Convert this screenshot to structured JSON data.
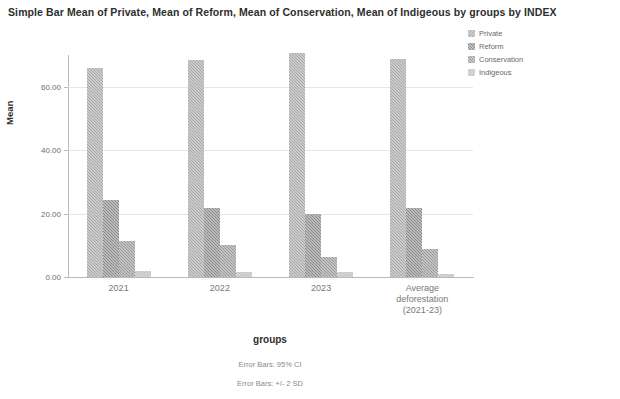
{
  "chart_data": {
    "type": "bar",
    "title": "Simple Bar Mean of Private, Mean of Reform, Mean of Conservation, Mean of Indigeous by groups by INDEX",
    "xlabel": "groups",
    "ylabel": "Mean",
    "ylim": [
      0,
      70
    ],
    "yticks": [
      0,
      20,
      40,
      60
    ],
    "ytick_labels": [
      "0.00",
      "20.00",
      "40.00",
      "60.00"
    ],
    "grid": true,
    "legend_position": "top-right",
    "categories": [
      "2021",
      "2022",
      "2023",
      "Average deforestation (2021-23)"
    ],
    "category_lines": [
      [
        "2021"
      ],
      [
        "2022"
      ],
      [
        "2023"
      ],
      [
        "Average",
        "deforestation",
        "(2021-23)"
      ]
    ],
    "series": [
      {
        "name": "Private",
        "color": "#a8a8a8",
        "values": [
          66.0,
          68.5,
          70.6,
          68.7
        ]
      },
      {
        "name": "Reform",
        "color": "#8c8c8c",
        "values": [
          24.2,
          21.8,
          19.8,
          21.9
        ]
      },
      {
        "name": "Conservation",
        "color": "#9a9a9a",
        "values": [
          11.3,
          10.0,
          6.2,
          8.9
        ]
      },
      {
        "name": "Indigeous",
        "color": "#bdbdbd",
        "values": [
          1.9,
          1.7,
          1.5,
          0.9
        ]
      }
    ],
    "annotations": [
      "Error Bars: 95% CI",
      "Error Bars: +/- 2 SD"
    ]
  }
}
